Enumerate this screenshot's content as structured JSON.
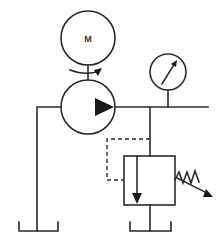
{
  "diagram": {
    "type": "hydraulic-schematic",
    "colors": {
      "line": "#2a2a2a",
      "background": "#ffffff"
    },
    "components": {
      "motor": {
        "label": "M",
        "symbol": "electric-motor"
      },
      "pump": {
        "symbol": "fixed-displacement-pump"
      },
      "gauge": {
        "symbol": "pressure-gauge"
      },
      "relief_valve": {
        "symbol": "pressure-relief-valve"
      },
      "tank_left": {
        "symbol": "reservoir"
      },
      "tank_right": {
        "symbol": "reservoir"
      }
    }
  }
}
